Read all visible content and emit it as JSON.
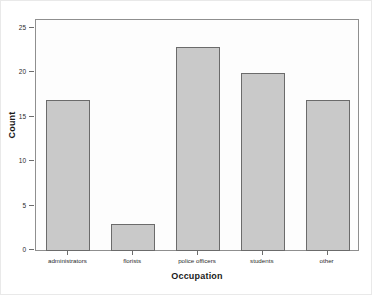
{
  "chart_data": {
    "type": "bar",
    "title": "",
    "subtitle": "",
    "categories": [
      "administrators",
      "florists",
      "police officers",
      "students",
      "other"
    ],
    "values": [
      17,
      3,
      23,
      20,
      17
    ],
    "xlabel": "Occupation",
    "ylabel": "Count",
    "ylim": [
      0,
      26
    ],
    "yticks": [
      0,
      5,
      10,
      15,
      20,
      25
    ],
    "ytick_labels": [
      "0",
      "5",
      "10",
      "15",
      "20",
      "25"
    ],
    "grid": false,
    "legend": false,
    "bar_fill_color": "#c9c9c9",
    "bar_border_color": "#6b6b6b",
    "plot_background": "#fdfdfd",
    "frame_color": "#8f8f8f"
  },
  "axes": {
    "y_title": "Count",
    "x_title": "Occupation"
  },
  "yticks": [
    {
      "label": "25",
      "value": 25
    },
    {
      "label": "20",
      "value": 20
    },
    {
      "label": "15",
      "value": 15
    },
    {
      "label": "10",
      "value": 10
    },
    {
      "label": "5",
      "value": 5
    },
    {
      "label": "0",
      "value": 0
    }
  ],
  "bars": [
    {
      "label": "administrators",
      "value": 17
    },
    {
      "label": "florists",
      "value": 3
    },
    {
      "label": "police officers",
      "value": 23
    },
    {
      "label": "students",
      "value": 20
    },
    {
      "label": "other",
      "value": 17
    }
  ]
}
